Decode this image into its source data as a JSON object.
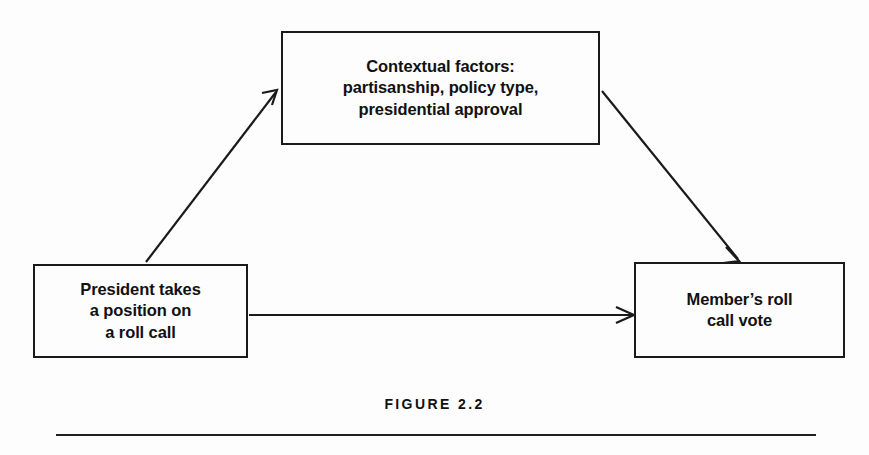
{
  "figure": {
    "caption": "FIGURE 2.2",
    "background_color": "#fdfdfd",
    "line_color": "#1a1a1a",
    "text_color": "#111111"
  },
  "nodes": {
    "context": {
      "label": "Contextual factors:\npartisanship, policy type,\npresidential approval"
    },
    "president": {
      "label": "President takes\na position on\na roll call"
    },
    "member": {
      "label": "Member’s roll\ncall vote"
    }
  },
  "edges": [
    {
      "id": "president-to-context",
      "from": "president",
      "to": "context",
      "style": "solid-arrow",
      "direction": "up-right"
    },
    {
      "id": "context-to-member",
      "from": "context",
      "to": "member",
      "style": "solid-arrow",
      "direction": "down-right"
    },
    {
      "id": "president-to-member",
      "from": "president",
      "to": "member",
      "style": "solid-arrow",
      "direction": "right"
    }
  ]
}
